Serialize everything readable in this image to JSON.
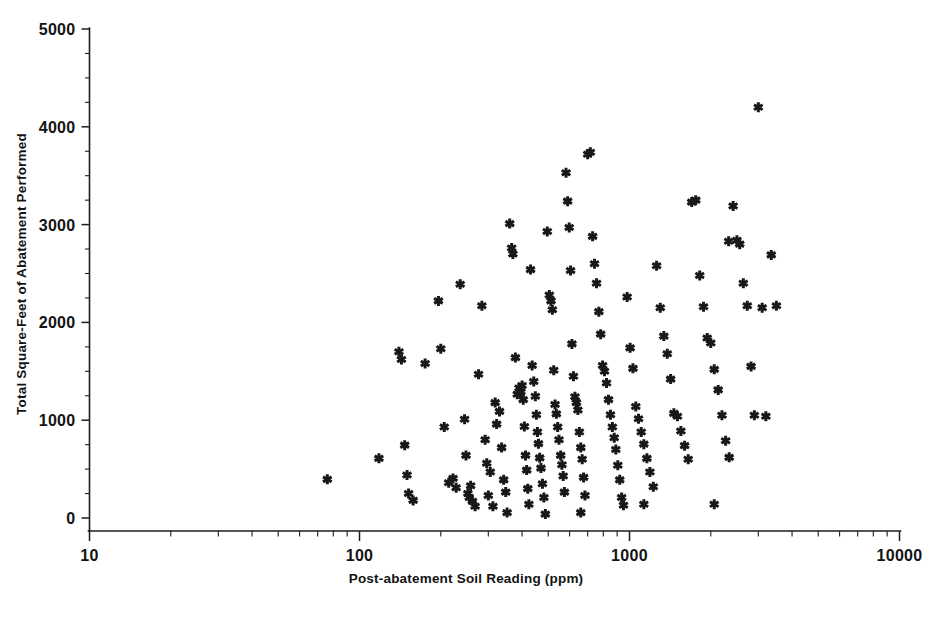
{
  "chart_data": {
    "type": "scatter",
    "title": "",
    "xlabel": "Post-abatement Soil Reading (ppm)",
    "ylabel": "Total Square-Feet of Abatement Performed",
    "xscale": "log",
    "yscale": "linear",
    "xlim": [
      10,
      10000
    ],
    "ylim": [
      0,
      5000
    ],
    "grid": false,
    "legend": null,
    "marker": "asterisk",
    "marker_color": "#181818",
    "xticks": [
      10,
      100,
      1000,
      10000
    ],
    "xticklabels": [
      "10",
      "100",
      "1000",
      "10000"
    ],
    "xminorticks": "log-decade-subdivisions",
    "yticks": [
      0,
      1000,
      2000,
      3000,
      4000,
      5000
    ],
    "yticklabels": [
      "0",
      "1000",
      "2000",
      "3000",
      "4000",
      "5000"
    ],
    "yminortick_interval": 250,
    "n_points": 152,
    "points": [
      [
        76,
        395
      ],
      [
        118,
        610
      ],
      [
        140,
        1700
      ],
      [
        143,
        1620
      ],
      [
        147,
        745
      ],
      [
        150,
        440
      ],
      [
        152,
        250
      ],
      [
        158,
        180
      ],
      [
        175,
        1580
      ],
      [
        196,
        2220
      ],
      [
        200,
        1730
      ],
      [
        206,
        930
      ],
      [
        214,
        360
      ],
      [
        222,
        405
      ],
      [
        228,
        310
      ],
      [
        236,
        2390
      ],
      [
        245,
        1010
      ],
      [
        248,
        640
      ],
      [
        252,
        250
      ],
      [
        255,
        210
      ],
      [
        258,
        330
      ],
      [
        262,
        170
      ],
      [
        268,
        120
      ],
      [
        276,
        1470
      ],
      [
        284,
        2170
      ],
      [
        292,
        800
      ],
      [
        296,
        560
      ],
      [
        300,
        230
      ],
      [
        305,
        470
      ],
      [
        312,
        120
      ],
      [
        318,
        1180
      ],
      [
        322,
        960
      ],
      [
        330,
        1090
      ],
      [
        336,
        720
      ],
      [
        342,
        390
      ],
      [
        348,
        265
      ],
      [
        352,
        55
      ],
      [
        360,
        3010
      ],
      [
        366,
        2760
      ],
      [
        370,
        2700
      ],
      [
        378,
        1640
      ],
      [
        384,
        1265
      ],
      [
        390,
        1330
      ],
      [
        396,
        1290
      ],
      [
        400,
        1355
      ],
      [
        404,
        1210
      ],
      [
        408,
        935
      ],
      [
        412,
        640
      ],
      [
        416,
        490
      ],
      [
        420,
        300
      ],
      [
        424,
        140
      ],
      [
        430,
        2540
      ],
      [
        436,
        1560
      ],
      [
        442,
        1395
      ],
      [
        448,
        1245
      ],
      [
        452,
        1055
      ],
      [
        456,
        880
      ],
      [
        460,
        760
      ],
      [
        465,
        615
      ],
      [
        470,
        510
      ],
      [
        476,
        350
      ],
      [
        482,
        210
      ],
      [
        488,
        40
      ],
      [
        496,
        2930
      ],
      [
        505,
        2280
      ],
      [
        512,
        2220
      ],
      [
        518,
        2130
      ],
      [
        524,
        1510
      ],
      [
        530,
        1160
      ],
      [
        536,
        1065
      ],
      [
        542,
        930
      ],
      [
        548,
        800
      ],
      [
        556,
        640
      ],
      [
        562,
        545
      ],
      [
        568,
        430
      ],
      [
        574,
        265
      ],
      [
        582,
        3530
      ],
      [
        590,
        3240
      ],
      [
        598,
        2970
      ],
      [
        605,
        2530
      ],
      [
        612,
        1780
      ],
      [
        620,
        1450
      ],
      [
        628,
        1240
      ],
      [
        636,
        1180
      ],
      [
        644,
        1105
      ],
      [
        652,
        880
      ],
      [
        660,
        720
      ],
      [
        668,
        600
      ],
      [
        676,
        415
      ],
      [
        684,
        230
      ],
      [
        700,
        3720
      ],
      [
        716,
        3740
      ],
      [
        730,
        2880
      ],
      [
        742,
        2600
      ],
      [
        755,
        2400
      ],
      [
        770,
        2110
      ],
      [
        782,
        1880
      ],
      [
        795,
        1560
      ],
      [
        808,
        1500
      ],
      [
        822,
        1380
      ],
      [
        836,
        1210
      ],
      [
        850,
        1055
      ],
      [
        864,
        930
      ],
      [
        878,
        820
      ],
      [
        890,
        700
      ],
      [
        905,
        540
      ],
      [
        920,
        390
      ],
      [
        935,
        210
      ],
      [
        950,
        130
      ],
      [
        980,
        2260
      ],
      [
        1005,
        1740
      ],
      [
        1030,
        1530
      ],
      [
        1055,
        1140
      ],
      [
        1080,
        1015
      ],
      [
        1105,
        880
      ],
      [
        1130,
        755
      ],
      [
        1160,
        610
      ],
      [
        1190,
        470
      ],
      [
        1225,
        320
      ],
      [
        1260,
        2580
      ],
      [
        1300,
        2150
      ],
      [
        1340,
        1860
      ],
      [
        1380,
        1680
      ],
      [
        1420,
        1420
      ],
      [
        1460,
        1070
      ],
      [
        1505,
        1040
      ],
      [
        1550,
        890
      ],
      [
        1600,
        740
      ],
      [
        1650,
        600
      ],
      [
        1700,
        3230
      ],
      [
        1760,
        3250
      ],
      [
        1820,
        2480
      ],
      [
        1880,
        2160
      ],
      [
        1940,
        1840
      ],
      [
        2000,
        1790
      ],
      [
        2060,
        1520
      ],
      [
        2130,
        1310
      ],
      [
        2200,
        1050
      ],
      [
        2270,
        790
      ],
      [
        2340,
        620
      ],
      [
        2420,
        3190
      ],
      [
        2500,
        2840
      ],
      [
        2560,
        2800
      ],
      [
        2640,
        2400
      ],
      [
        2730,
        2170
      ],
      [
        2820,
        1550
      ],
      [
        2900,
        1050
      ],
      [
        3000,
        4200
      ],
      [
        3100,
        2150
      ],
      [
        3200,
        1040
      ],
      [
        3350,
        2690
      ],
      [
        3500,
        2170
      ],
      [
        1130,
        140
      ],
      [
        2060,
        140
      ],
      [
        660,
        55
      ],
      [
        2330,
        2830
      ]
    ]
  },
  "axes": {
    "x_title": "Post-abatement Soil Reading (ppm)",
    "y_title": "Total Square-Feet of Abatement Performed"
  },
  "caption": {
    "clipped_text": ""
  }
}
